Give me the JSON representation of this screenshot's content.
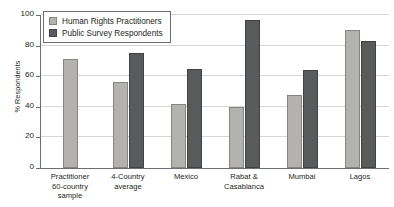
{
  "chart_data": {
    "type": "bar",
    "title": "",
    "xlabel": "",
    "ylabel": "% Respondents",
    "ylim": [
      0,
      100
    ],
    "ytick_values": [
      0,
      20,
      40,
      60,
      80,
      100
    ],
    "ytick_labels": [
      "0",
      "20",
      "40",
      "60",
      "80",
      "100"
    ],
    "grid": true,
    "legend_position": "top-left",
    "categories": [
      "Practitioner 60-country sample",
      "4-Country average",
      "Mexico",
      "Rabat & Casablanca",
      "Mumbai",
      "Lagos"
    ],
    "category_label_lines": [
      [
        "Practitioner",
        "60-country sample"
      ],
      [
        "4-Country",
        "average"
      ],
      [
        "Mexico"
      ],
      [
        "Rabat &",
        "Casablanca"
      ],
      [
        "Mumbai"
      ],
      [
        "Lagos"
      ]
    ],
    "series": [
      {
        "name": "Human Rights Practitioners",
        "color": "#b3b2ae",
        "values": [
          71,
          56,
          42,
          40,
          48,
          90
        ]
      },
      {
        "name": "Public Survey Respondents",
        "color": "#595a5c",
        "values": [
          null,
          75,
          65,
          97,
          64,
          83
        ]
      }
    ]
  },
  "legend": {
    "items": [
      {
        "label": "Human Rights Practitioners",
        "swatch": "light"
      },
      {
        "label": "Public Survey Respondents",
        "swatch": "dark"
      }
    ]
  },
  "axis": {
    "y_title": "% Respondents"
  },
  "colors": {
    "light_bar": "#b3b2ae",
    "dark_bar": "#595a5c",
    "axis": "#6d6e71",
    "grid": "#d8d6d4",
    "text": "#231f20",
    "background": "#ffffff"
  }
}
